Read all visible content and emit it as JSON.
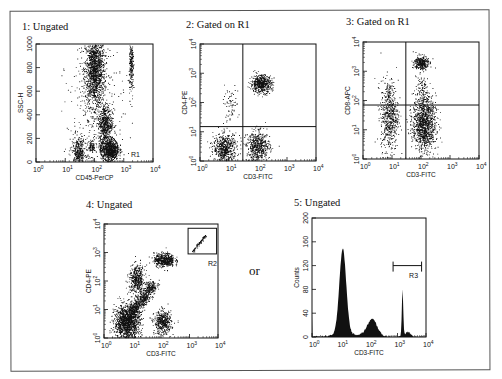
{
  "figure": {
    "or_label": "or",
    "panels": [
      {
        "id": "p1",
        "title": "1: Ungated",
        "xlabel": "CD45-PerCP",
        "ylabel": "SSC-H",
        "yscale": "linear",
        "ylim": [
          0,
          1000
        ],
        "yticks": [
          "0",
          "200",
          "400",
          "600",
          "800",
          "1000"
        ],
        "xticks": [
          "10^0",
          "10^1",
          "10^2",
          "10^3",
          "10^4"
        ]
      },
      {
        "id": "p2",
        "title": "2: Gated on R1",
        "xlabel": "CD3-FITC",
        "ylabel": "CD4-PE",
        "yscale": "log",
        "xticks": [
          "10^0",
          "10^1",
          "10^2",
          "10^3",
          "10^4"
        ],
        "yticks": [
          "10^0",
          "10^1",
          "10^2",
          "10^3",
          "10^4"
        ]
      },
      {
        "id": "p3",
        "title": "3: Gated on R1",
        "xlabel": "CD3-FITC",
        "ylabel": "CD8-APC",
        "yscale": "log",
        "xticks": [
          "10^0",
          "10^1",
          "10^2",
          "10^3",
          "10^4"
        ],
        "yticks": [
          "10^0",
          "10^1",
          "10^2",
          "10^3",
          "10^4"
        ]
      },
      {
        "id": "p4",
        "title": "4: Ungated",
        "xlabel": "CD3-FITC",
        "ylabel": "CD4-PE",
        "yscale": "log",
        "xticks": [
          "10^0",
          "10^1",
          "10^2",
          "10^3",
          "10^4"
        ],
        "yticks": [
          "10^0",
          "10^1",
          "10^2",
          "10^3",
          "10^4"
        ]
      },
      {
        "id": "p5",
        "title": "5: Ungated",
        "xlabel": "CD3-FITC",
        "ylabel": "Counts",
        "yscale": "linear",
        "ylim": [
          0,
          200
        ],
        "yticks": [
          "0",
          "40",
          "80",
          "120",
          "160",
          "200"
        ],
        "xticks": [
          "10^0",
          "10^1",
          "10^2",
          "10^3",
          "10^4"
        ]
      }
    ]
  },
  "chart_data": [
    {
      "type": "scatter",
      "title": "1: Ungated",
      "xlabel": "CD45-PerCP",
      "ylabel": "SSC-H",
      "xscale": "log",
      "xlim": [
        1,
        10000
      ],
      "ylim": [
        0,
        1000
      ],
      "gates": [
        {
          "name": "R1",
          "shape": "ellipse",
          "center_x_log": 2.5,
          "center_y": 110,
          "rx_log": 0.4,
          "ry": 95
        }
      ],
      "clusters": [
        {
          "name": "granulocytes",
          "x_log": 2.0,
          "y": 780,
          "sx": 0.17,
          "sy": 150,
          "n": 1400
        },
        {
          "name": "monocytes",
          "x_log": 2.35,
          "y": 330,
          "sx": 0.12,
          "sy": 80,
          "n": 500
        },
        {
          "name": "lymphocytes",
          "x_log": 2.5,
          "y": 110,
          "sx": 0.15,
          "sy": 45,
          "n": 800
        },
        {
          "name": "eosinophils",
          "x_log": 3.25,
          "y": 800,
          "sx": 0.04,
          "sy": 120,
          "n": 220
        },
        {
          "name": "debris",
          "x_log": 1.45,
          "y": 80,
          "sx": 0.12,
          "sy": 60,
          "n": 350
        },
        {
          "name": "small-cluster",
          "x_log": 1.9,
          "y": 130,
          "sx": 0.06,
          "sy": 25,
          "n": 90
        },
        {
          "name": "background",
          "x_log": 2.0,
          "y": 400,
          "sx": 0.5,
          "sy": 280,
          "n": 300
        }
      ]
    },
    {
      "type": "scatter",
      "title": "2: Gated on R1",
      "xlabel": "CD3-FITC",
      "ylabel": "CD4-PE",
      "xscale": "log",
      "yscale": "log",
      "xlim": [
        1,
        10000
      ],
      "ylim": [
        1,
        10000
      ],
      "quadrant_lines": {
        "x": 30,
        "y": 15
      },
      "clusters": [
        {
          "name": "CD3+CD4+",
          "x_log": 2.1,
          "y_log": 2.65,
          "sx": 0.18,
          "sy": 0.15,
          "n": 550
        },
        {
          "name": "CD3-CD4-",
          "x_log": 0.85,
          "y_log": 0.45,
          "sx": 0.2,
          "sy": 0.25,
          "n": 550
        },
        {
          "name": "CD3+CD4-",
          "x_log": 2.0,
          "y_log": 0.5,
          "sx": 0.2,
          "sy": 0.25,
          "n": 550
        },
        {
          "name": "CD3-CD4dim",
          "x_log": 1.0,
          "y_log": 1.9,
          "sx": 0.15,
          "sy": 0.3,
          "n": 70
        }
      ]
    },
    {
      "type": "scatter",
      "title": "3: Gated on R1",
      "xlabel": "CD3-FITC",
      "ylabel": "CD8-APC",
      "xscale": "log",
      "yscale": "log",
      "xlim": [
        1,
        10000
      ],
      "ylim": [
        1,
        10000
      ],
      "quadrant_lines": {
        "x": 30,
        "y": 70
      },
      "clusters": [
        {
          "name": "CD3+CD8+",
          "x_log": 2.0,
          "y_log": 3.3,
          "sx": 0.12,
          "sy": 0.12,
          "n": 300
        },
        {
          "name": "CD3+CD8-",
          "x_log": 2.1,
          "y_log": 1.2,
          "sx": 0.2,
          "sy": 0.45,
          "n": 1100
        },
        {
          "name": "CD3-",
          "x_log": 0.9,
          "y_log": 1.5,
          "sx": 0.15,
          "sy": 0.6,
          "n": 600
        },
        {
          "name": "CD3+trail",
          "x_log": 2.0,
          "y_log": 2.3,
          "sx": 0.12,
          "sy": 0.4,
          "n": 120
        }
      ]
    },
    {
      "type": "scatter",
      "title": "4: Ungated",
      "xlabel": "CD3-FITC",
      "ylabel": "CD4-PE",
      "xscale": "log",
      "yscale": "log",
      "xlim": [
        1,
        10000
      ],
      "ylim": [
        1,
        10000
      ],
      "gates": [
        {
          "name": "R2",
          "shape": "rectangle",
          "x_log": [
            2.95,
            3.95
          ],
          "y_log": [
            2.95,
            3.85
          ]
        }
      ],
      "clusters": [
        {
          "name": "CD3+CD4+",
          "x_log": 2.1,
          "y_log": 2.75,
          "sx": 0.18,
          "sy": 0.12,
          "n": 500
        },
        {
          "name": "CD3-CD4+",
          "x_log": 1.15,
          "y_log": 2.05,
          "sx": 0.14,
          "sy": 0.25,
          "n": 450
        },
        {
          "name": "CD3-CD4-",
          "x_log": 0.8,
          "y_log": 0.55,
          "sx": 0.22,
          "sy": 0.3,
          "n": 1300
        },
        {
          "name": "CD3+CD4-",
          "x_log": 2.05,
          "y_log": 0.55,
          "sx": 0.15,
          "sy": 0.2,
          "n": 450
        },
        {
          "name": "diagonal",
          "diagonal": true,
          "from_log": [
            0.9,
            0.8
          ],
          "to_log": [
            1.75,
            1.9
          ],
          "spread": 0.1,
          "n": 700
        },
        {
          "name": "beads",
          "diagonal": true,
          "from_log": [
            3.1,
            3.05
          ],
          "to_log": [
            3.55,
            3.6
          ],
          "spread": 0.02,
          "n": 80
        }
      ]
    },
    {
      "type": "area",
      "title": "5: Ungated",
      "xlabel": "CD3-FITC",
      "ylabel": "Counts",
      "xscale": "log",
      "xlim": [
        1,
        10000
      ],
      "ylim": [
        0,
        200
      ],
      "gates": [
        {
          "name": "R3",
          "shape": "marker",
          "x": [
            700,
            7000
          ],
          "y": 120
        }
      ],
      "peaks": [
        {
          "x": 12,
          "height": 145,
          "width_log": 0.12
        },
        {
          "x": 130,
          "height": 28,
          "width_log": 0.17
        },
        {
          "x": 1500,
          "height": 78,
          "width_log": 0.025
        },
        {
          "x": 2300,
          "height": 8,
          "width_log": 0.1
        }
      ],
      "baseline": 4
    }
  ]
}
